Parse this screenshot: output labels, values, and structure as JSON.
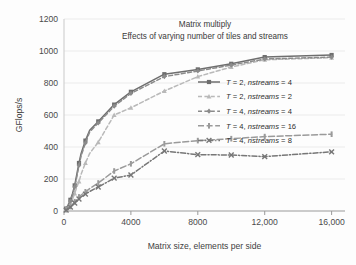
{
  "chart_data": {
    "type": "line",
    "title": "Matrix multiply",
    "subtitle": "Effects of varying number of tiles and streams",
    "xlabel": "Matrix size, elements per side",
    "ylabel": "GFlops/s",
    "xlim": [
      0,
      16800
    ],
    "ylim": [
      0,
      1200
    ],
    "xticks": [
      0,
      4000,
      8000,
      12000,
      16000
    ],
    "xticklabels": [
      "0",
      "4000",
      "8000",
      "12,000",
      "16,000"
    ],
    "yticks": [
      0,
      200,
      400,
      600,
      800,
      1000,
      1200
    ],
    "yticklabels": [
      "0",
      "200",
      "400",
      "600",
      "800",
      "1000",
      "1200"
    ],
    "grid": "horizontal",
    "legend_position": "center-right",
    "series": [
      {
        "name": "T = 2, nstreams = 4",
        "label_prefix": "T",
        "label_var": "nstreams",
        "tiles": 2,
        "nstreams": 4,
        "color": "#6e6e6e",
        "dash": "none",
        "marker": "square",
        "x": [
          128,
          256,
          384,
          512,
          640,
          768,
          896,
          1024,
          1280,
          1536,
          2048,
          3000,
          4000,
          6000,
          8000,
          10000,
          12000,
          16000
        ],
        "y": [
          15,
          40,
          70,
          110,
          160,
          230,
          300,
          360,
          440,
          505,
          560,
          665,
          745,
          855,
          885,
          920,
          962,
          975
        ]
      },
      {
        "name": "T = 2, nstreams = 2",
        "label_prefix": "T",
        "label_var": "nstreams",
        "tiles": 2,
        "nstreams": 2,
        "color": "#b9b9b9",
        "dash": "dashed",
        "marker": "triangle",
        "x": [
          128,
          256,
          384,
          512,
          640,
          768,
          896,
          1024,
          1280,
          1536,
          2048,
          3000,
          4000,
          6000,
          8000,
          10000,
          12000,
          16000
        ],
        "y": [
          12,
          28,
          48,
          75,
          110,
          150,
          185,
          230,
          300,
          360,
          430,
          600,
          645,
          750,
          840,
          900,
          945,
          958
        ]
      },
      {
        "name": "T = 4, nstreams = 4",
        "label_prefix": "T",
        "label_var": "nstreams",
        "tiles": 4,
        "nstreams": 4,
        "color": "#8b8b8b",
        "dash": "dashed",
        "marker": "diamond",
        "x": [
          128,
          256,
          384,
          512,
          640,
          768,
          896,
          1024,
          1280,
          1536,
          2048,
          3000,
          4000,
          6000,
          8000,
          10000,
          12000,
          16000
        ],
        "y": [
          14,
          35,
          62,
          100,
          150,
          215,
          285,
          345,
          425,
          495,
          550,
          655,
          735,
          840,
          875,
          912,
          950,
          962
        ]
      },
      {
        "name": "T = 4, nstreams = 16",
        "label_prefix": "T",
        "label_var": "nstreams",
        "tiles": 4,
        "nstreams": 16,
        "color": "#9a9a9a",
        "dash": "longdash",
        "marker": "bar",
        "x": [
          128,
          256,
          384,
          512,
          640,
          768,
          896,
          1024,
          1280,
          1536,
          2048,
          3000,
          4000,
          6000,
          8000,
          10000,
          12000,
          16000
        ],
        "y": [
          8,
          18,
          28,
          42,
          58,
          72,
          88,
          100,
          120,
          140,
          175,
          250,
          295,
          420,
          440,
          452,
          465,
          480
        ]
      },
      {
        "name": "T = 4, nstreams = 8",
        "label_prefix": "T",
        "label_var": "nstreams",
        "tiles": 4,
        "nstreams": 8,
        "color": "#777777",
        "dash": "dashdot",
        "marker": "x",
        "x": [
          128,
          256,
          384,
          512,
          640,
          768,
          896,
          1024,
          1280,
          1536,
          2048,
          3000,
          4000,
          6000,
          8000,
          10000,
          12000,
          16000
        ],
        "y": [
          6,
          14,
          24,
          36,
          50,
          62,
          75,
          88,
          105,
          122,
          150,
          205,
          225,
          375,
          352,
          350,
          340,
          370
        ]
      }
    ]
  },
  "legend": {
    "entries": [
      {
        "t": "T",
        "eq1": " = 2, ",
        "var": "nstreams",
        "eq2": " = 4"
      },
      {
        "t": "T",
        "eq1": " = 2, ",
        "var": "nstreams",
        "eq2": " = 2"
      },
      {
        "t": "T",
        "eq1": " = 4, ",
        "var": "nstreams",
        "eq2": " = 4"
      },
      {
        "t": "T",
        "eq1": " = 4, ",
        "var": "nstreams",
        "eq2": " = 16"
      },
      {
        "t": "T",
        "eq1": " = 4, ",
        "var": "nstreams",
        "eq2": " = 8"
      }
    ]
  }
}
